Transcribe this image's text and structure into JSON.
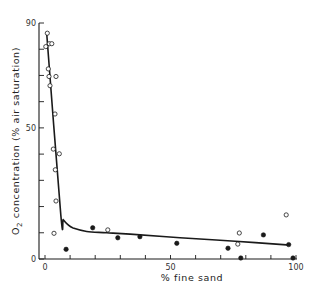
{
  "chart_data": {
    "type": "scatter",
    "title": "",
    "xlabel": "% fine sand",
    "ylabel": "O2 concentration (% air saturation)",
    "ylabel_parts": {
      "pre": "O",
      "sub": "2",
      "post": " concentration  (% air  saturation)"
    },
    "xlim": [
      0,
      100
    ],
    "ylim": [
      0,
      90
    ],
    "xticks_labeled": [
      0,
      50,
      100
    ],
    "yticks_labeled": [
      0,
      50,
      90
    ],
    "xtick_labels": [
      "0",
      "50",
      "100"
    ],
    "ytick_labels": [
      "0",
      "50",
      "90"
    ],
    "xtick_minor_step": 10,
    "ytick_minor_step": 10,
    "grid": false,
    "legend": null,
    "series": [
      {
        "name": "open circles",
        "marker": "open-circle",
        "points": [
          [
            0.9,
            86.1
          ],
          [
            0.3,
            81.0
          ],
          [
            1.7,
            82.1
          ],
          [
            2.7,
            82.1
          ],
          [
            1.3,
            72.5
          ],
          [
            1.6,
            69.6
          ],
          [
            4.4,
            69.6
          ],
          [
            2.0,
            66.1
          ],
          [
            4.0,
            55.3
          ],
          [
            3.3,
            41.9
          ],
          [
            5.7,
            40.1
          ],
          [
            4.1,
            34.0
          ],
          [
            4.4,
            22.1
          ],
          [
            3.6,
            9.8
          ],
          [
            25.0,
            11.1
          ],
          [
            77.4,
            9.9
          ],
          [
            76.8,
            5.7
          ],
          [
            96.1,
            16.8
          ]
        ]
      },
      {
        "name": "filled circles",
        "marker": "filled-circle",
        "points": [
          [
            8.4,
            3.7
          ],
          [
            19.0,
            11.9
          ],
          [
            29.0,
            8.1
          ],
          [
            37.8,
            8.5
          ],
          [
            52.5,
            6.0
          ],
          [
            72.9,
            4.1
          ],
          [
            87.0,
            9.2
          ],
          [
            97.1,
            5.5
          ],
          [
            78.0,
            0.4
          ],
          [
            98.8,
            0.4
          ]
        ]
      },
      {
        "name": "fitted curve",
        "marker": "line",
        "points": [
          [
            0.7,
            85.5
          ],
          [
            6.3,
            16.8
          ],
          [
            7.3,
            15.0
          ],
          [
            9.0,
            13.2
          ],
          [
            11.2,
            11.8
          ],
          [
            16.6,
            10.5
          ],
          [
            24.5,
            10.0
          ],
          [
            33.9,
            9.5
          ],
          [
            53.8,
            8.1
          ],
          [
            75.8,
            6.8
          ],
          [
            97.6,
            5.3
          ]
        ]
      }
    ]
  },
  "colors": {
    "ink": "#1a1a1a",
    "background": "#ffffff"
  }
}
